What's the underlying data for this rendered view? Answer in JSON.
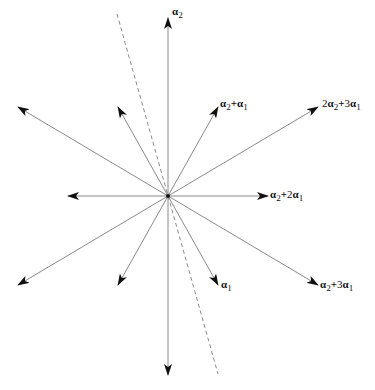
{
  "diagram": {
    "type": "root-system",
    "title": "",
    "origin": {
      "x": 168,
      "y": 196
    },
    "colors": {
      "line": "#8a8a8a",
      "arrowhead": "#111111",
      "text": "#111111"
    },
    "vectors": [
      {
        "id": "alpha2",
        "tip": {
          "x": 168,
          "y": 18
        },
        "label": "α2",
        "label_parts": [
          [
            "α",
            "2"
          ]
        ],
        "label_pos": {
          "x": 172,
          "y": 12
        }
      },
      {
        "id": "alpha2-plus-alpha1",
        "tip": {
          "x": 218,
          "y": 107
        },
        "label": "α2+α1",
        "label_pos": {
          "x": 220,
          "y": 101
        }
      },
      {
        "id": "2alpha2-plus-3alpha1",
        "tip": {
          "x": 318,
          "y": 107
        },
        "label": "2α2+3α1",
        "label_pos": {
          "x": 322,
          "y": 101
        }
      },
      {
        "id": "alpha2-plus-2alpha1",
        "tip": {
          "x": 268,
          "y": 196
        },
        "label": "α2+2α1",
        "label_pos": {
          "x": 270,
          "y": 190
        }
      },
      {
        "id": "alpha2-plus-3alpha1",
        "tip": {
          "x": 318,
          "y": 285
        },
        "label": "α2+3α1",
        "label_pos": {
          "x": 320,
          "y": 279
        }
      },
      {
        "id": "alpha1",
        "tip": {
          "x": 218,
          "y": 285
        },
        "label": "α1",
        "label_pos": {
          "x": 221,
          "y": 279
        }
      },
      {
        "id": "neg-alpha2",
        "tip": {
          "x": 168,
          "y": 375
        },
        "label": ""
      },
      {
        "id": "neg-alpha2-minus-alpha1",
        "tip": {
          "x": 118,
          "y": 285
        },
        "label": ""
      },
      {
        "id": "neg-2alpha2-minus-3alpha1",
        "tip": {
          "x": 18,
          "y": 285
        },
        "label": ""
      },
      {
        "id": "neg-alpha2-minus-2alpha1",
        "tip": {
          "x": 68,
          "y": 196
        },
        "label": ""
      },
      {
        "id": "neg-alpha2-minus-3alpha1",
        "tip": {
          "x": 18,
          "y": 107
        },
        "label": ""
      },
      {
        "id": "neg-alpha1",
        "tip": {
          "x": 118,
          "y": 107
        },
        "label": ""
      }
    ],
    "dashed_line": {
      "from": {
        "x": 117,
        "y": 14
      },
      "to": {
        "x": 218,
        "y": 374
      }
    },
    "labels": {
      "alpha2": {
        "main": "α",
        "sub": "2"
      },
      "alpha2_plus_alpha1": {
        "a": "α",
        "a_sub": "2",
        "op": "+",
        "b": "α",
        "b_sub": "1"
      },
      "two_alpha2_plus_3alpha1": {
        "c1": "2",
        "a": "α",
        "a_sub": "2",
        "op": "+",
        "c2": "3",
        "b": "α",
        "b_sub": "1"
      },
      "alpha2_plus_2alpha1": {
        "a": "α",
        "a_sub": "2",
        "op": "+",
        "c2": "2",
        "b": "α",
        "b_sub": "1"
      },
      "alpha2_plus_3alpha1": {
        "a": "α",
        "a_sub": "2",
        "op": "+",
        "c2": "3",
        "b": "α",
        "b_sub": "1"
      },
      "alpha1": {
        "main": "α",
        "sub": "1"
      }
    },
    "caption_visible": "partially cut off at bottom edge (illegible)"
  }
}
